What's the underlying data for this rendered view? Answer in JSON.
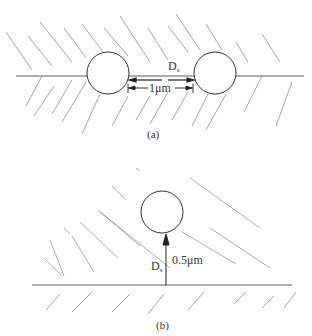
{
  "panels": [
    {
      "id": "a",
      "caption": "(a)",
      "description": "Two spheres resting on a horizontal plane separated by a gap",
      "separation_label": "D",
      "separation_sub": "s",
      "distance_label": "1μm"
    },
    {
      "id": "b",
      "caption": "(b)",
      "description": "Single sphere above a horizontal plane with vertical distance arrow",
      "separation_label": "D",
      "separation_sub": "s",
      "distance_label": "0.5μm"
    }
  ],
  "colors": {
    "line": "#333333",
    "hatch": "#555555",
    "background": "#ffffff"
  }
}
